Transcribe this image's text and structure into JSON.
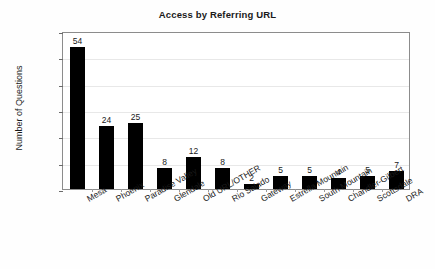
{
  "chart_data": {
    "type": "bar",
    "title": "Access by Referring URL",
    "xlabel": "",
    "ylabel": "Number of Questions",
    "ylim": [
      0,
      60
    ],
    "ytick_step": 10,
    "grid": true,
    "legend": false,
    "bar_color": "#000000",
    "categories": [
      "Mesa",
      "Phoenix",
      "Paradise Valley",
      "Glendale",
      "Old URL/OTHER",
      "Rio Salado",
      "Gateway",
      "Estrella Mountain",
      "South Mountain",
      "Chandler-Gilbert",
      "Scottsdale",
      "DRA"
    ],
    "values": [
      54,
      24,
      25,
      8,
      12,
      8,
      2,
      5,
      5,
      4,
      5,
      7
    ],
    "value_labels": [
      "54",
      "24",
      "25",
      "8",
      "12",
      "8",
      "2",
      "5",
      "5",
      "4",
      "5",
      "7"
    ],
    "ytick_labels": [
      "0",
      "10",
      "20",
      "30",
      "40",
      "50",
      "60"
    ],
    "ytick_values": [
      0,
      10,
      20,
      30,
      40,
      50,
      60
    ]
  }
}
